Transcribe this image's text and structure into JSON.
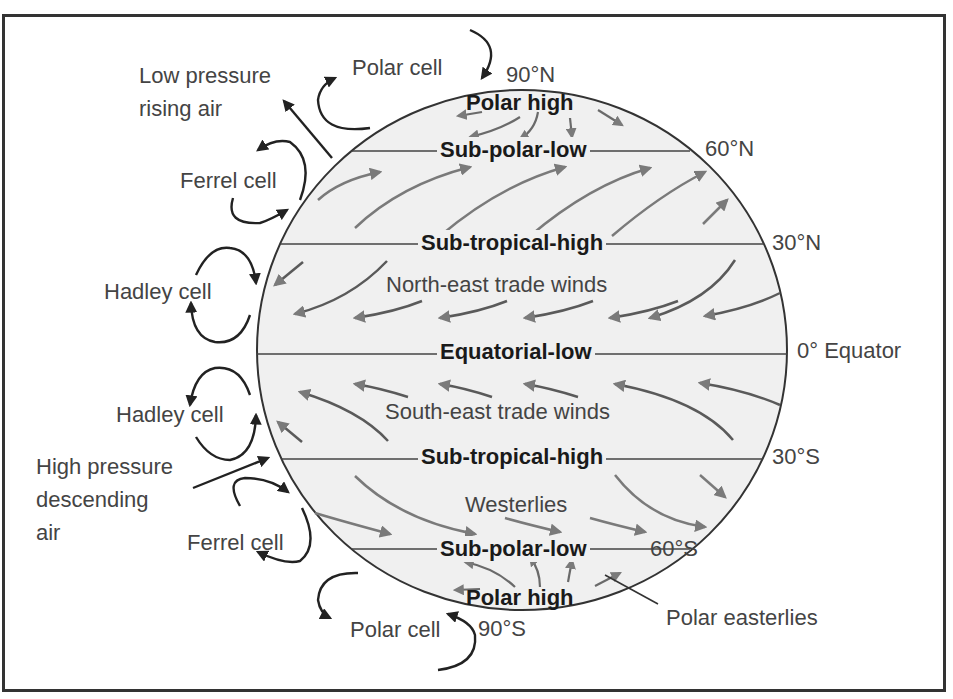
{
  "diagram": {
    "colors": {
      "globe_fill": "#f0f0f0",
      "globe_outline": "#333333",
      "latitude_line": "#444444",
      "wind_arrow": "#7a7a7a",
      "cell_arrow": "#222222",
      "label_text": "#444444",
      "zone_text": "#1a1a1a",
      "border": "#333333"
    },
    "latitudes": {
      "north_pole": "90°N",
      "lat_60n": "60°N",
      "lat_30n": "30°N",
      "equator": "0° Equator",
      "lat_30s": "30°S",
      "lat_60s": "60°S",
      "south_pole": "90°S"
    },
    "pressure_zones": {
      "polar_high_north": "Polar high",
      "sub_polar_low_north": "Sub-polar-low",
      "sub_tropical_high_north": "Sub-tropical-high",
      "equatorial_low": "Equatorial-low",
      "sub_tropical_high_south": "Sub-tropical-high",
      "sub_polar_low_south": "Sub-polar-low",
      "polar_high_south": "Polar high"
    },
    "winds": {
      "ne_trades": "North-east trade winds",
      "se_trades": "South-east trade winds",
      "westerlies": "Westerlies",
      "polar_easterlies": "Polar easterlies"
    },
    "cells": {
      "polar_north": "Polar cell",
      "ferrel_north": "Ferrel cell",
      "hadley_north": "Hadley cell",
      "hadley_south": "Hadley cell",
      "ferrel_south": "Ferrel cell",
      "polar_south": "Polar cell"
    },
    "annotations": {
      "low_pressure_line1": "Low pressure",
      "low_pressure_line2": "rising air",
      "high_pressure_line1": "High pressure",
      "high_pressure_line2": "descending",
      "high_pressure_line3": "air"
    }
  }
}
